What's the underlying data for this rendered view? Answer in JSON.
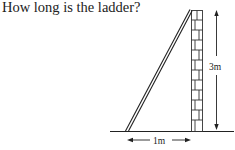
{
  "question": "How long is the ladder?",
  "diagram": {
    "wall_height_label": "3m",
    "base_distance_label": "1m",
    "stroke_color": "#222222",
    "background": "#ffffff"
  }
}
